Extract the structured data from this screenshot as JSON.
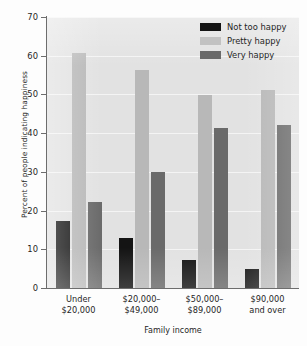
{
  "chart_data": {
    "type": "bar",
    "title": "",
    "xlabel": "Family income",
    "ylabel": "Percent of people indicating happiness",
    "categories": [
      "Under\n$20,000",
      "$20,000–\n$49,000",
      "$50,000–\n$89,000",
      "$90,000\nand over"
    ],
    "category_lines": [
      [
        "Under",
        "$20,000"
      ],
      [
        "$20,000–",
        "$49,000"
      ],
      [
        "$50,000–",
        "$89,000"
      ],
      [
        "$90,000",
        "and over"
      ]
    ],
    "series": [
      {
        "name": "Not too happy",
        "color": "#141414",
        "values": [
          17.2,
          12.9,
          7.2,
          4.9
        ]
      },
      {
        "name": "Pretty happy",
        "color": "#b8b8b8",
        "values": [
          60.6,
          56.3,
          49.8,
          51.1
        ]
      },
      {
        "name": "Very happy",
        "color": "#6a6a6a",
        "values": [
          22.1,
          30.0,
          41.3,
          42.2
        ]
      }
    ],
    "ylim": [
      0,
      70
    ],
    "yticks": [
      0,
      10,
      20,
      30,
      40,
      50,
      60,
      70
    ],
    "ytick_labels": [
      "0",
      "10",
      "20",
      "30",
      "40",
      "50",
      "60",
      "70"
    ],
    "grid": true,
    "grid_axis": "y",
    "legend_position": "top-right",
    "plot_background": "#e2e2e2"
  },
  "legend": {
    "items": [
      {
        "label": "Not too happy"
      },
      {
        "label": "Pretty happy"
      },
      {
        "label": "Very happy"
      }
    ]
  }
}
